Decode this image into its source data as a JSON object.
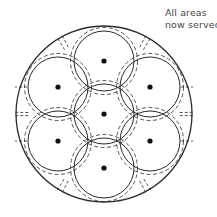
{
  "caption": {
    "line1": "All areas",
    "line2": "now served"
  },
  "colors": {
    "stroke": "#2a2a2a",
    "dot": "#111111",
    "background": "#ffffff"
  },
  "diagram": {
    "center": [
      104,
      114
    ],
    "cell_radius": 30,
    "outer_radius": 88,
    "cells": [
      {
        "name": "center",
        "x": 104,
        "y": 114
      },
      {
        "name": "top",
        "x": 104,
        "y": 61
      },
      {
        "name": "upper-right",
        "x": 150,
        "y": 87
      },
      {
        "name": "lower-right",
        "x": 150,
        "y": 141
      },
      {
        "name": "bottom",
        "x": 104,
        "y": 168
      },
      {
        "name": "lower-left",
        "x": 58,
        "y": 141
      },
      {
        "name": "upper-left",
        "x": 58,
        "y": 87
      }
    ]
  }
}
